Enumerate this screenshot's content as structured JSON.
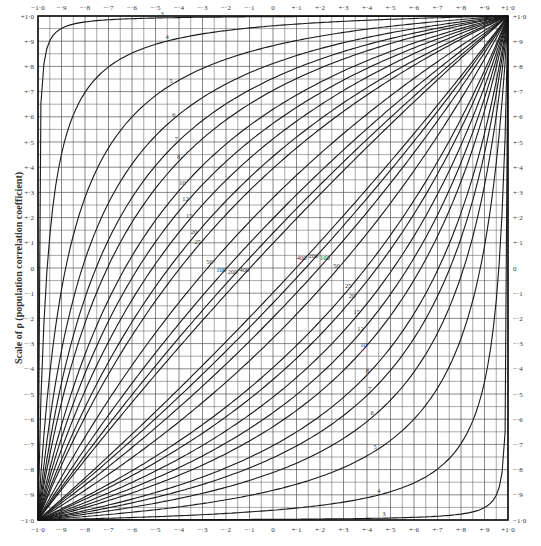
{
  "chart_data": {
    "type": "line",
    "title": "",
    "xlabel": "",
    "ylabel": "Scale of ρ (population correlation coefficient)",
    "xlim": [
      -1.0,
      1.0
    ],
    "ylim": [
      -1.0,
      1.0
    ],
    "grid": true,
    "grid_step": 0.05,
    "x_ticks": [
      "−1·0",
      "−·9",
      "−·8",
      "−·7",
      "−·6",
      "−·5",
      "−·4",
      "−·3",
      "−·2",
      "−·1",
      "0",
      "+·1",
      "+·2",
      "+·3",
      "+·4",
      "+·5",
      "+·6",
      "+·7",
      "+·8",
      "+·9",
      "+1·0"
    ],
    "y_ticks": [
      "+1·0",
      "+·9",
      "+·8",
      "+·7",
      "+·6",
      "+·5",
      "+·4",
      "+·3",
      "+·2",
      "+·1",
      "0",
      "−·1",
      "−·2",
      "−·3",
      "−·4",
      "−·5",
      "−·6",
      "−·7",
      "−·8",
      "−·9",
      "−1·0"
    ],
    "sample_sizes": [
      3,
      4,
      5,
      6,
      7,
      8,
      10,
      12,
      15,
      20,
      25,
      50,
      100,
      200,
      400
    ],
    "series_description": "Confidence belts: for each sample size n, an upper and lower curve relating sample r (x) to population ρ (y); curves pass through (−1,−1) and (+1,+1), approaching the diagonal as n increases.",
    "series": [
      {
        "name": "n=3 upper",
        "n": 3,
        "branch": "upper"
      },
      {
        "name": "n=4 upper",
        "n": 4,
        "branch": "upper"
      },
      {
        "name": "n=5 upper",
        "n": 5,
        "branch": "upper"
      },
      {
        "name": "n=6 upper",
        "n": 6,
        "branch": "upper"
      },
      {
        "name": "n=7 upper",
        "n": 7,
        "branch": "upper"
      },
      {
        "name": "n=8 upper",
        "n": 8,
        "branch": "upper"
      },
      {
        "name": "n=10 upper",
        "n": 10,
        "branch": "upper"
      },
      {
        "name": "n=12 upper",
        "n": 12,
        "branch": "upper"
      },
      {
        "name": "n=15 upper",
        "n": 15,
        "branch": "upper"
      },
      {
        "name": "n=20 upper",
        "n": 20,
        "branch": "upper"
      },
      {
        "name": "n=25 upper",
        "n": 25,
        "branch": "upper"
      },
      {
        "name": "n=50 upper",
        "n": 50,
        "branch": "upper"
      },
      {
        "name": "n=100 upper",
        "n": 100,
        "branch": "upper"
      },
      {
        "name": "n=200 upper",
        "n": 200,
        "branch": "upper"
      },
      {
        "name": "n=400 upper",
        "n": 400,
        "branch": "upper"
      },
      {
        "name": "n=400 lower",
        "n": 400,
        "branch": "lower"
      },
      {
        "name": "n=200 lower",
        "n": 200,
        "branch": "lower"
      },
      {
        "name": "n=100 lower",
        "n": 100,
        "branch": "lower"
      },
      {
        "name": "n=50 lower",
        "n": 50,
        "branch": "lower"
      },
      {
        "name": "n=25 lower",
        "n": 25,
        "branch": "lower"
      },
      {
        "name": "n=20 lower",
        "n": 20,
        "branch": "lower"
      },
      {
        "name": "n=15 lower",
        "n": 15,
        "branch": "lower"
      },
      {
        "name": "n=12 lower",
        "n": 12,
        "branch": "lower"
      },
      {
        "name": "n=10 lower",
        "n": 10,
        "branch": "lower"
      },
      {
        "name": "n=8 lower",
        "n": 8,
        "branch": "lower"
      },
      {
        "name": "n=7 lower",
        "n": 7,
        "branch": "lower"
      },
      {
        "name": "n=6 lower",
        "n": 6,
        "branch": "lower"
      },
      {
        "name": "n=5 lower",
        "n": 5,
        "branch": "lower"
      },
      {
        "name": "n=4 lower",
        "n": 4,
        "branch": "lower"
      },
      {
        "name": "n=3 lower",
        "n": 3,
        "branch": "lower"
      }
    ],
    "curve_labels_upper": [
      "3",
      "4",
      "5",
      "6",
      "7",
      "8",
      "10",
      "12",
      "15",
      "20",
      "25",
      "50",
      "100",
      "200",
      "400"
    ],
    "curve_labels_lower": [
      "400",
      "200",
      "100",
      "50",
      "25",
      "20",
      "15",
      "12",
      "10",
      "8",
      "7",
      "6",
      "5",
      "4",
      "3"
    ],
    "colors": {
      "line": "#1a1a1a",
      "grid": "#555555",
      "background": "#ffffff"
    }
  }
}
